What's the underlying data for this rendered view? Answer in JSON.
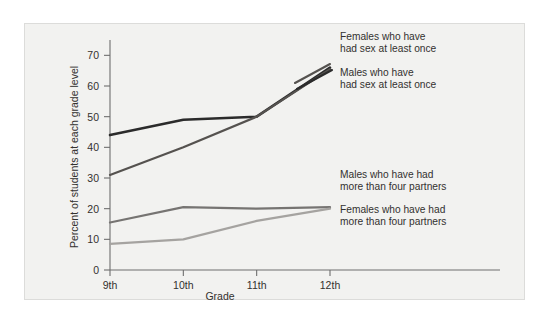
{
  "chart_data": {
    "type": "line",
    "title": "",
    "xlabel": "Grade",
    "ylabel": "Percent of students at each grade level",
    "categories": [
      "9th",
      "10th",
      "11th",
      "12th"
    ],
    "ylim": [
      0,
      75
    ],
    "yticks": [
      0,
      10,
      20,
      30,
      40,
      50,
      60,
      70
    ],
    "grid": false,
    "legend_position": "inline-annotations",
    "series": [
      {
        "name": "Males who have had sex at least once",
        "values": [
          44,
          49,
          50,
          66
        ],
        "color": "#2b2b2b"
      },
      {
        "name": "Females who have had sex at least once",
        "values": [
          31,
          40,
          50,
          65.5
        ],
        "color": "#55524f"
      },
      {
        "name": "Males who have had more than four partners",
        "values": [
          15.5,
          20.5,
          20,
          20.5
        ],
        "color": "#767472"
      },
      {
        "name": "Females who have had more than four partners",
        "values": [
          8.5,
          10,
          16,
          20
        ],
        "color": "#a5a3a0"
      }
    ],
    "annotations": [
      {
        "id": "annotation-females-sex",
        "line1": "Females who have",
        "line2": "had sex at least once"
      },
      {
        "id": "annotation-males-sex",
        "line1": "Males who have",
        "line2": "had sex at least once"
      },
      {
        "id": "annotation-males-partners",
        "line1": "Males who have had",
        "line2": "more than four partners"
      },
      {
        "id": "annotation-females-partners",
        "line1": "Females who have had",
        "line2": "more than four partners"
      }
    ]
  }
}
